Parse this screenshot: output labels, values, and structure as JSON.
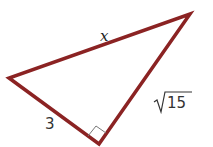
{
  "diagram": {
    "type": "right-triangle",
    "stroke_color": "#8b2323",
    "right_angle_marker_color": "#777777",
    "vertices": {
      "left": [
        9,
        78
      ],
      "right_angle": [
        99,
        144
      ],
      "top": [
        190,
        14
      ]
    },
    "labels": {
      "hypotenuse": "x",
      "leg_left": "3",
      "leg_right_radicand": "15"
    }
  }
}
